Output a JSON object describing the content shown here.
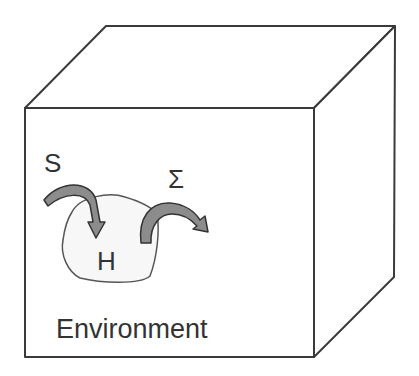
{
  "diagram": {
    "labels": {
      "system": "S",
      "heat_bath": "H",
      "sigma": "Σ",
      "environment": "Environment"
    },
    "colors": {
      "edge": "#3a3a3a",
      "arrow_fill": "#8c8c8c",
      "blob_stroke": "#555555",
      "text": "#333333"
    }
  }
}
